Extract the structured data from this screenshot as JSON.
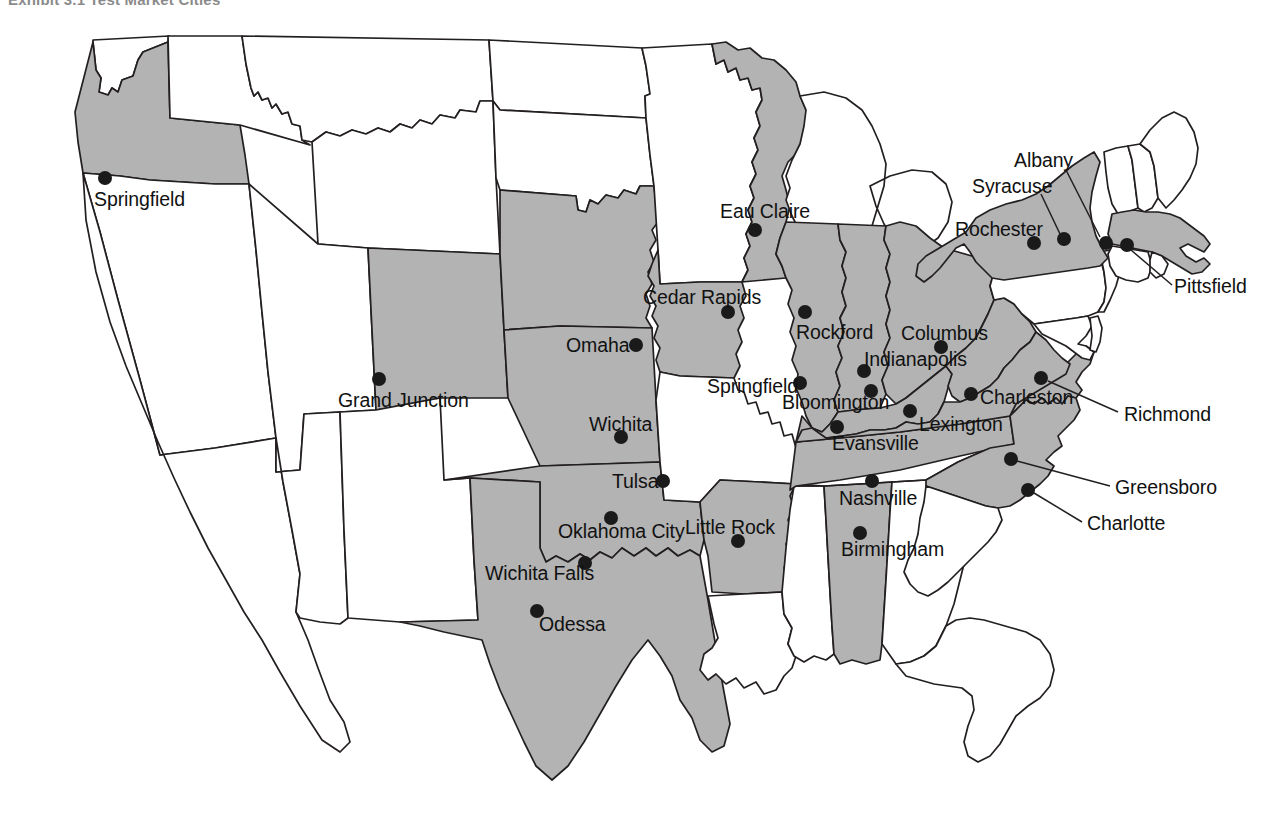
{
  "exhibit": {
    "title": "Exhibit 3.1  Test Market Cities"
  },
  "map": {
    "type": "choropleth-point-map",
    "region": "United States (contiguous 48 states)",
    "shaded_fill_hex": "#b3b3b3",
    "unshaded_fill_hex": "#ffffff",
    "outline_hex": "#231f20",
    "dot_hex": "#1a1a1a",
    "shaded_states": [
      "Oregon",
      "Colorado",
      "Nebraska",
      "Kansas",
      "Oklahoma",
      "Texas",
      "Iowa",
      "Wisconsin",
      "Illinois",
      "Indiana",
      "Ohio",
      "Kentucky",
      "Tennessee",
      "Alabama",
      "Arkansas",
      "West Virginia",
      "Virginia",
      "North Carolina",
      "New York",
      "Massachusetts"
    ],
    "unshaded_states": [
      "Washington",
      "Idaho",
      "Montana",
      "North Dakota",
      "South Dakota",
      "Minnesota",
      "Wyoming",
      "Utah",
      "Nevada",
      "California",
      "Arizona",
      "New Mexico",
      "Missouri",
      "Michigan",
      "Pennsylvania",
      "New Jersey",
      "Maryland",
      "Delaware",
      "Connecticut",
      "Rhode Island",
      "Vermont",
      "New Hampshire",
      "Maine",
      "South Carolina",
      "Georgia",
      "Florida",
      "Mississippi",
      "Louisiana"
    ]
  },
  "cities": [
    {
      "name": "Springfield",
      "state": "Oregon",
      "dot_x": 105,
      "dot_y": 178,
      "label_x": 94,
      "label_y": 190,
      "label_anchor": "left",
      "leader": null
    },
    {
      "name": "Grand Junction",
      "state": "Colorado",
      "dot_x": 379,
      "dot_y": 379,
      "label_x": 338,
      "label_y": 391,
      "label_anchor": "left",
      "leader": null
    },
    {
      "name": "Omaha",
      "state": "Nebraska",
      "dot_x": 636,
      "dot_y": 345,
      "label_x": 566,
      "label_y": 336,
      "label_anchor": "left",
      "leader": null
    },
    {
      "name": "Wichita",
      "state": "Kansas",
      "dot_x": 621,
      "dot_y": 437,
      "label_x": 589,
      "label_y": 415,
      "label_anchor": "left",
      "leader": null
    },
    {
      "name": "Tulsa",
      "state": "Oklahoma",
      "dot_x": 663,
      "dot_y": 481,
      "label_x": 612,
      "label_y": 472,
      "label_anchor": "left",
      "leader": null
    },
    {
      "name": "Oklahoma City",
      "state": "Oklahoma",
      "dot_x": 611,
      "dot_y": 518,
      "label_x": 558,
      "label_y": 522,
      "label_anchor": "left",
      "leader": null
    },
    {
      "name": "Wichita Falls",
      "state": "Texas",
      "dot_x": 585,
      "dot_y": 563,
      "label_x": 485,
      "label_y": 564,
      "label_anchor": "left",
      "leader": null
    },
    {
      "name": "Odessa",
      "state": "Texas",
      "dot_x": 537,
      "dot_y": 611,
      "label_x": 539,
      "label_y": 615,
      "label_anchor": "left",
      "leader": null
    },
    {
      "name": "Eau Claire",
      "state": "Wisconsin",
      "dot_x": 755,
      "dot_y": 230,
      "label_x": 720,
      "label_y": 202,
      "label_anchor": "left",
      "leader": null
    },
    {
      "name": "Cedar Rapids",
      "state": "Iowa",
      "dot_x": 728,
      "dot_y": 312,
      "label_x": 643,
      "label_y": 288,
      "label_anchor": "left",
      "leader": null
    },
    {
      "name": "Rockford",
      "state": "Illinois",
      "dot_x": 805,
      "dot_y": 312,
      "label_x": 796,
      "label_y": 323,
      "label_anchor": "left",
      "leader": null
    },
    {
      "name": "Springfield",
      "state": "Illinois",
      "dot_x": 800,
      "dot_y": 383,
      "label_x": 707,
      "label_y": 377,
      "label_anchor": "left",
      "leader": null
    },
    {
      "name": "Bloomington",
      "state": "Indiana",
      "dot_x": 871,
      "dot_y": 391,
      "label_x": 782,
      "label_y": 393,
      "label_anchor": "left",
      "leader": null
    },
    {
      "name": "Indianapolis",
      "state": "Indiana",
      "dot_x": 864,
      "dot_y": 371,
      "label_x": 864,
      "label_y": 350,
      "label_anchor": "left",
      "leader": null
    },
    {
      "name": "Evansville",
      "state": "Indiana",
      "dot_x": 837,
      "dot_y": 427,
      "label_x": 832,
      "label_y": 434,
      "label_anchor": "left",
      "leader": null
    },
    {
      "name": "Columbus",
      "state": "Ohio",
      "dot_x": 941,
      "dot_y": 347,
      "label_x": 901,
      "label_y": 324,
      "label_anchor": "left",
      "leader": null
    },
    {
      "name": "Lexington",
      "state": "Kentucky",
      "dot_x": 910,
      "dot_y": 411,
      "label_x": 919,
      "label_y": 415,
      "label_anchor": "left",
      "leader": null
    },
    {
      "name": "Charleston",
      "state": "West Virginia",
      "dot_x": 971,
      "dot_y": 394,
      "label_x": 980,
      "label_y": 388,
      "label_anchor": "left",
      "leader": null
    },
    {
      "name": "Nashville",
      "state": "Tennessee",
      "dot_x": 872,
      "dot_y": 481,
      "label_x": 839,
      "label_y": 489,
      "label_anchor": "left",
      "leader": null
    },
    {
      "name": "Little Rock",
      "state": "Arkansas",
      "dot_x": 738,
      "dot_y": 541,
      "label_x": 685,
      "label_y": 518,
      "label_anchor": "left",
      "leader": null
    },
    {
      "name": "Birmingham",
      "state": "Alabama",
      "dot_x": 860,
      "dot_y": 533,
      "label_x": 841,
      "label_y": 540,
      "label_anchor": "left",
      "leader": null
    },
    {
      "name": "Richmond",
      "state": "Virginia",
      "dot_x": 1041,
      "dot_y": 378,
      "label_x": 1124,
      "label_y": 405,
      "label_anchor": "left",
      "leader": {
        "x1": 1048,
        "y1": 381,
        "x2": 1118,
        "y2": 412
      }
    },
    {
      "name": "Greensboro",
      "state": "North Carolina",
      "dot_x": 1011,
      "dot_y": 459,
      "label_x": 1115,
      "label_y": 478,
      "label_anchor": "left",
      "leader": {
        "x1": 1017,
        "y1": 461,
        "x2": 1110,
        "y2": 486
      }
    },
    {
      "name": "Charlotte",
      "state": "North Carolina",
      "dot_x": 1028,
      "dot_y": 490,
      "label_x": 1087,
      "label_y": 514,
      "label_anchor": "left",
      "leader": {
        "x1": 1034,
        "y1": 493,
        "x2": 1082,
        "y2": 522
      }
    },
    {
      "name": "Rochester",
      "state": "New York",
      "dot_x": 1034,
      "dot_y": 243,
      "label_x": 955,
      "label_y": 220,
      "label_anchor": "left",
      "leader": null
    },
    {
      "name": "Syracuse",
      "state": "New York",
      "dot_x": 1064,
      "dot_y": 239,
      "label_x": 972,
      "label_y": 177,
      "label_anchor": "left",
      "leader": {
        "x1": 1060,
        "y1": 234,
        "x2": 1041,
        "y2": 194
      }
    },
    {
      "name": "Albany",
      "state": "New York",
      "dot_x": 1106,
      "dot_y": 243,
      "label_x": 1014,
      "label_y": 151,
      "label_anchor": "left",
      "leader": {
        "x1": 1100,
        "y1": 237,
        "x2": 1066,
        "y2": 170
      }
    },
    {
      "name": "Pittsfield",
      "state": "Massachusetts",
      "dot_x": 1127,
      "dot_y": 245,
      "label_x": 1174,
      "label_y": 277,
      "label_anchor": "left",
      "leader": {
        "x1": 1131,
        "y1": 250,
        "x2": 1172,
        "y2": 285
      }
    }
  ]
}
